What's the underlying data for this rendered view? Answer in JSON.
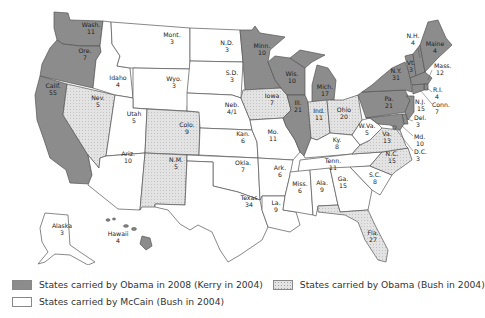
{
  "map": {
    "type": "choropleth",
    "subject": "2008 U.S. presidential election electoral votes by state",
    "colors": {
      "obama_kerry": "#8c8c8c",
      "obama_bush": "#e3e3e3",
      "mccain_bush": "#ffffff",
      "border": "#555555"
    },
    "states": {
      "wash": {
        "name": "Wash.",
        "ev": "11",
        "cat": "dem"
      },
      "ore": {
        "name": "Ore.",
        "ev": "7",
        "cat": "dem"
      },
      "calif": {
        "name": "Calif.",
        "ev": "55",
        "cat": "dem"
      },
      "nev": {
        "name": "Nev.",
        "ev": "5",
        "cat": "flip"
      },
      "idaho": {
        "name": "Idaho",
        "ev": "4",
        "cat": "rep"
      },
      "mont": {
        "name": "Mont.",
        "ev": "3",
        "cat": "rep"
      },
      "wyo": {
        "name": "Wyo.",
        "ev": "3",
        "cat": "rep"
      },
      "utah": {
        "name": "Utah",
        "ev": "5",
        "cat": "rep"
      },
      "ariz": {
        "name": "Ariz.",
        "ev": "10",
        "cat": "rep"
      },
      "colo": {
        "name": "Colo.",
        "ev": "9",
        "cat": "flip"
      },
      "nm": {
        "name": "N.M.",
        "ev": "5",
        "cat": "flip"
      },
      "nd": {
        "name": "N.D.",
        "ev": "3",
        "cat": "rep"
      },
      "sd": {
        "name": "S.D.",
        "ev": "3",
        "cat": "rep"
      },
      "neb": {
        "name": "Neb.",
        "ev": "4/1",
        "cat": "rep"
      },
      "kan": {
        "name": "Kan.",
        "ev": "6",
        "cat": "rep"
      },
      "okla": {
        "name": "Okla.",
        "ev": "7",
        "cat": "rep"
      },
      "texas": {
        "name": "Texas",
        "ev": "34",
        "cat": "rep"
      },
      "minn": {
        "name": "Minn.",
        "ev": "10",
        "cat": "dem"
      },
      "iowa": {
        "name": "Iowa",
        "ev": "7",
        "cat": "flip"
      },
      "mo": {
        "name": "Mo.",
        "ev": "11",
        "cat": "rep"
      },
      "ark": {
        "name": "Ark.",
        "ev": "6",
        "cat": "rep"
      },
      "la": {
        "name": "La.",
        "ev": "9",
        "cat": "rep"
      },
      "wis": {
        "name": "Wis.",
        "ev": "10",
        "cat": "dem"
      },
      "ill": {
        "name": "Ill.",
        "ev": "21",
        "cat": "dem"
      },
      "mich": {
        "name": "Mich.",
        "ev": "17",
        "cat": "dem"
      },
      "ind": {
        "name": "Ind.",
        "ev": "11",
        "cat": "flip"
      },
      "ohio": {
        "name": "Ohio",
        "ev": "20",
        "cat": "flip"
      },
      "ky": {
        "name": "Ky.",
        "ev": "8",
        "cat": "rep"
      },
      "tenn": {
        "name": "Tenn.",
        "ev": "11",
        "cat": "rep"
      },
      "miss": {
        "name": "Miss.",
        "ev": "6",
        "cat": "rep"
      },
      "ala": {
        "name": "Ala.",
        "ev": "9",
        "cat": "rep"
      },
      "ga": {
        "name": "Ga.",
        "ev": "15",
        "cat": "rep"
      },
      "fla": {
        "name": "Fla.",
        "ev": "27",
        "cat": "flip"
      },
      "sc": {
        "name": "S.C.",
        "ev": "8",
        "cat": "rep"
      },
      "nc": {
        "name": "N.C.",
        "ev": "15",
        "cat": "flip"
      },
      "va": {
        "name": "Va.",
        "ev": "13",
        "cat": "flip"
      },
      "wva": {
        "name": "W.Va.",
        "ev": "5",
        "cat": "rep"
      },
      "pa": {
        "name": "Pa.",
        "ev": "21",
        "cat": "dem"
      },
      "ny": {
        "name": "N.Y.",
        "ev": "31",
        "cat": "dem"
      },
      "vt": {
        "name": "Vt.",
        "ev": "3",
        "cat": "dem"
      },
      "nh": {
        "name": "N.H.",
        "ev": "4",
        "cat": "dem"
      },
      "maine": {
        "name": "Maine",
        "ev": "4",
        "cat": "dem"
      },
      "mass": {
        "name": "Mass.",
        "ev": "12",
        "cat": "dem"
      },
      "ri": {
        "name": "R.I.",
        "ev": "4",
        "cat": "dem"
      },
      "conn": {
        "name": "Conn.",
        "ev": "7",
        "cat": "dem"
      },
      "nj": {
        "name": "N.J.",
        "ev": "15",
        "cat": "dem"
      },
      "del": {
        "name": "Del.",
        "ev": "3",
        "cat": "dem"
      },
      "md": {
        "name": "Md.",
        "ev": "10",
        "cat": "dem"
      },
      "dc": {
        "name": "D.C.",
        "ev": "3",
        "cat": "dem"
      },
      "alaska": {
        "name": "Alaska",
        "ev": "3",
        "cat": "rep"
      },
      "hawaii": {
        "name": "Hawaii",
        "ev": "4",
        "cat": "dem"
      }
    }
  },
  "legend": {
    "items": [
      {
        "label": "States carried by Obama in 2008 (Kerry in 2004)",
        "swatch": "dem"
      },
      {
        "label": "States carried by Obama (Bush in 2004)",
        "swatch": "flip"
      },
      {
        "label": "States carried by McCain (Bush in 2004)",
        "swatch": "rep"
      }
    ]
  }
}
